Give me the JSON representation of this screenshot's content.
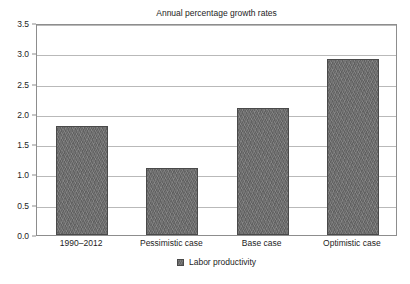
{
  "chart_data": {
    "type": "bar",
    "title": "Annual percentage growth rates",
    "xlabel": "",
    "ylabel": "",
    "categories": [
      "1990–2012",
      "Pessimistic case",
      "Base case",
      "Optimistic case"
    ],
    "series": [
      {
        "name": "Labor productivity",
        "values": [
          1.8,
          1.1,
          2.1,
          2.9
        ]
      }
    ],
    "ylim": [
      0.0,
      3.5
    ],
    "ytick_labels": [
      "0.0",
      "0.5",
      "1.0",
      "1.5",
      "2.0",
      "2.5",
      "3.0",
      "3.5"
    ],
    "ytick_values": [
      0.0,
      0.5,
      1.0,
      1.5,
      2.0,
      2.5,
      3.0,
      3.5
    ],
    "grid": true,
    "legend_position": "bottom",
    "legend_entries": [
      {
        "label": "Labor productivity",
        "color": "#6e6e6e"
      }
    ],
    "colors": {
      "bar_fill": "#6e6e6e",
      "bar_border": "#4a4a4a",
      "gridline": "#b9b9b9",
      "frame": "#8d8d8d",
      "text": "#1d1d1d",
      "background": "#ffffff"
    }
  }
}
